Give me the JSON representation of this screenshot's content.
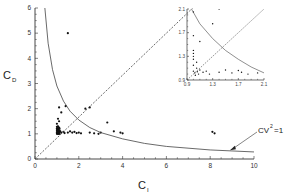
{
  "chart_data": [
    {
      "id": "main",
      "type": "scatter",
      "title": "",
      "xlabel": "C",
      "xlabel_subscript": "I",
      "ylabel": "C",
      "ylabel_subscript": "D",
      "xlim": [
        0,
        10
      ],
      "ylim": [
        0,
        6
      ],
      "xticks": [
        0,
        2,
        4,
        6,
        8,
        10
      ],
      "yticks": [
        0,
        1,
        2,
        3,
        4,
        5,
        6
      ],
      "grid": false,
      "legend": null,
      "series": [
        {
          "name": "data points",
          "kind": "scatter",
          "points": [
            [
              1.5,
              5.0
            ],
            [
              1.1,
              2.05
            ],
            [
              1.4,
              2.1
            ],
            [
              1.2,
              1.85
            ],
            [
              2.3,
              2.0
            ],
            [
              2.5,
              2.05
            ],
            [
              1.05,
              1.6
            ],
            [
              1.1,
              1.5
            ],
            [
              1.0,
              1.4
            ],
            [
              1.05,
              1.3
            ],
            [
              1.1,
              1.25
            ],
            [
              1.0,
              1.2
            ],
            [
              1.05,
              1.15
            ],
            [
              1.1,
              1.1
            ],
            [
              1.0,
              1.05
            ],
            [
              1.05,
              1.02
            ],
            [
              1.15,
              1.1
            ],
            [
              1.2,
              1.05
            ],
            [
              1.3,
              1.08
            ],
            [
              1.35,
              1.03
            ],
            [
              1.5,
              1.05
            ],
            [
              1.6,
              1.1
            ],
            [
              1.7,
              1.05
            ],
            [
              1.8,
              1.08
            ],
            [
              1.9,
              1.03
            ],
            [
              2.0,
              1.05
            ],
            [
              2.1,
              1.02
            ],
            [
              2.5,
              1.05
            ],
            [
              2.7,
              1.02
            ],
            [
              2.9,
              1.0
            ],
            [
              3.0,
              1.05
            ],
            [
              3.3,
              1.45
            ],
            [
              3.6,
              1.1
            ],
            [
              3.9,
              1.05
            ],
            [
              4.0,
              1.02
            ],
            [
              8.1,
              1.08
            ],
            [
              8.2,
              1.02
            ]
          ]
        },
        {
          "name": "y = x",
          "kind": "line",
          "style": "dashed",
          "x": [
            0,
            7.2
          ],
          "y": [
            0,
            6
          ]
        },
        {
          "name": "CV^2 = 1",
          "kind": "line",
          "style": "solid",
          "function": "y = 1/(x - 1) + 1 scaled hyperbola",
          "x": [
            0.45,
            0.6,
            0.8,
            1.0,
            1.3,
            1.6,
            2.0,
            2.5,
            3.0,
            4.0,
            5.0,
            6.0,
            8.0,
            10.0
          ],
          "y": [
            6.0,
            4.6,
            3.55,
            2.9,
            2.3,
            1.9,
            1.55,
            1.25,
            1.05,
            0.8,
            0.62,
            0.5,
            0.36,
            0.28
          ]
        }
      ],
      "annotations": [
        {
          "text": "CV",
          "superscript": "2",
          "suffix": "=1",
          "arrow_to": [
            8.9,
            0.35
          ]
        }
      ]
    },
    {
      "id": "inset",
      "type": "scatter",
      "title": "",
      "xlim": [
        0.9,
        2.1
      ],
      "ylim": [
        0.9,
        2.1
      ],
      "xticks": [
        0.9,
        1.3,
        1.7,
        2.1
      ],
      "yticks": [
        0.9,
        1.3,
        1.7,
        2.1
      ],
      "xtick_labels": [
        "0.9",
        "1.3",
        "1.7",
        "2.1"
      ],
      "ytick_labels": [
        "0.9",
        "1.3",
        "1.7",
        "2.1"
      ],
      "grid": false,
      "series": [
        {
          "name": "data points",
          "kind": "scatter",
          "points": [
            [
              1.0,
              2.05
            ],
            [
              1.4,
              2.1
            ],
            [
              1.3,
              1.85
            ],
            [
              1.0,
              1.65
            ],
            [
              1.1,
              1.55
            ],
            [
              1.0,
              1.4
            ],
            [
              1.0,
              1.35
            ],
            [
              1.0,
              1.3
            ],
            [
              1.0,
              1.25
            ],
            [
              1.05,
              1.2
            ],
            [
              1.0,
              1.15
            ],
            [
              1.05,
              1.1
            ],
            [
              1.0,
              1.05
            ],
            [
              1.02,
              1.02
            ],
            [
              1.06,
              1.04
            ],
            [
              1.08,
              1.0
            ],
            [
              1.03,
              0.98
            ],
            [
              1.1,
              1.07
            ],
            [
              1.15,
              1.03
            ],
            [
              1.2,
              1.05
            ],
            [
              1.25,
              1.0
            ],
            [
              1.4,
              1.03
            ],
            [
              1.5,
              1.07
            ],
            [
              1.6,
              1.02
            ],
            [
              1.7,
              1.06
            ],
            [
              1.75,
              1.03
            ],
            [
              1.85,
              1.0
            ],
            [
              2.0,
              1.02
            ]
          ]
        },
        {
          "name": "y = x",
          "kind": "line",
          "style": "dashed",
          "x": [
            0.9,
            2.1
          ],
          "y": [
            0.9,
            2.1
          ]
        },
        {
          "name": "CV^2 = 1",
          "kind": "line",
          "style": "solid",
          "x": [
            0.97,
            1.1,
            1.3,
            1.5,
            1.7,
            1.9,
            2.1
          ],
          "y": [
            2.1,
            1.85,
            1.6,
            1.4,
            1.25,
            1.12,
            1.02
          ]
        }
      ]
    }
  ],
  "labels": {
    "x_axis": "C",
    "x_axis_sub": "I",
    "y_axis": "C",
    "y_axis_sub": "D",
    "annotation_main": "CV",
    "annotation_sup": "2",
    "annotation_suffix": "=1"
  }
}
